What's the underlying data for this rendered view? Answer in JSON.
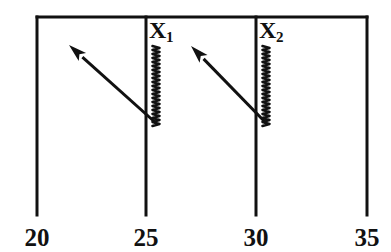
{
  "figure": {
    "type": "diagram",
    "title": "",
    "background_color": "#ffffff",
    "ink_color": "#111111",
    "width": 391,
    "height": 252
  },
  "axis": {
    "orientation": "horizontal",
    "tick_labels": [
      "20",
      "25",
      "30",
      "35"
    ],
    "tick_values": [
      20,
      25,
      30,
      35
    ],
    "tick_x_positions": [
      37,
      146,
      256,
      367
    ],
    "label_baseline_y": 246,
    "range": [
      20,
      35
    ]
  },
  "vertical_lines": [
    {
      "name": "line-20",
      "x": 37,
      "y_top": 17,
      "y_bottom": 215,
      "stroke_width": 3
    },
    {
      "name": "line-25",
      "x": 146,
      "y_top": 17,
      "y_bottom": 215,
      "stroke_width": 3
    },
    {
      "name": "line-30",
      "x": 256,
      "y_top": 17,
      "y_bottom": 215,
      "stroke_width": 3
    },
    {
      "name": "line-35",
      "x": 367,
      "y_top": 17,
      "y_bottom": 215,
      "stroke_width": 3
    }
  ],
  "top_bar": {
    "name": "top-horizontal-bar",
    "x_start": 37,
    "x_end": 367,
    "y": 17,
    "stroke_width": 3
  },
  "coils": [
    {
      "id": "x1",
      "label_main": "X",
      "label_sub": "1",
      "label_x": 149,
      "label_y": 38,
      "coil_x": 156,
      "coil_y_top": 46,
      "coil_y_bottom": 126,
      "coil_half_width": 3.5,
      "coil_turns": 20
    },
    {
      "id": "x2",
      "label_main": "X",
      "label_sub": "2",
      "label_x": 259,
      "label_y": 38,
      "coil_x": 266,
      "coil_y_top": 46,
      "coil_y_bottom": 126,
      "coil_half_width": 3.5,
      "coil_turns": 20
    }
  ],
  "arrows": [
    {
      "id": "arrow-1",
      "tail_x": 157,
      "tail_y": 124,
      "tip_x": 69,
      "tip_y": 45,
      "direction": "up-left",
      "head_length": 18,
      "head_width": 11
    },
    {
      "id": "arrow-2",
      "tail_x": 267,
      "tail_y": 124,
      "tip_x": 191,
      "tip_y": 46,
      "direction": "up-left",
      "head_length": 18,
      "head_width": 11
    }
  ]
}
